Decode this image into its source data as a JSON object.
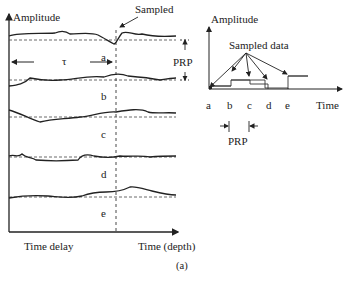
{
  "left_panel": {
    "y_axis_label": "Amplitude",
    "sampled_label": "Sampled",
    "tau_label": "τ",
    "prp_label": "PRP",
    "trace_labels": [
      "a",
      "b",
      "c",
      "d",
      "e"
    ],
    "x_label_left": "Time delay",
    "x_label_right": "Time (depth)"
  },
  "right_panel": {
    "y_axis_label": "Amplitude",
    "sampled_data_label": "Sampled data",
    "x_tick_labels": [
      "a",
      "b",
      "c",
      "d",
      "e"
    ],
    "x_axis_label": "Time",
    "prp_label": "PRP"
  },
  "caption": "(a)"
}
